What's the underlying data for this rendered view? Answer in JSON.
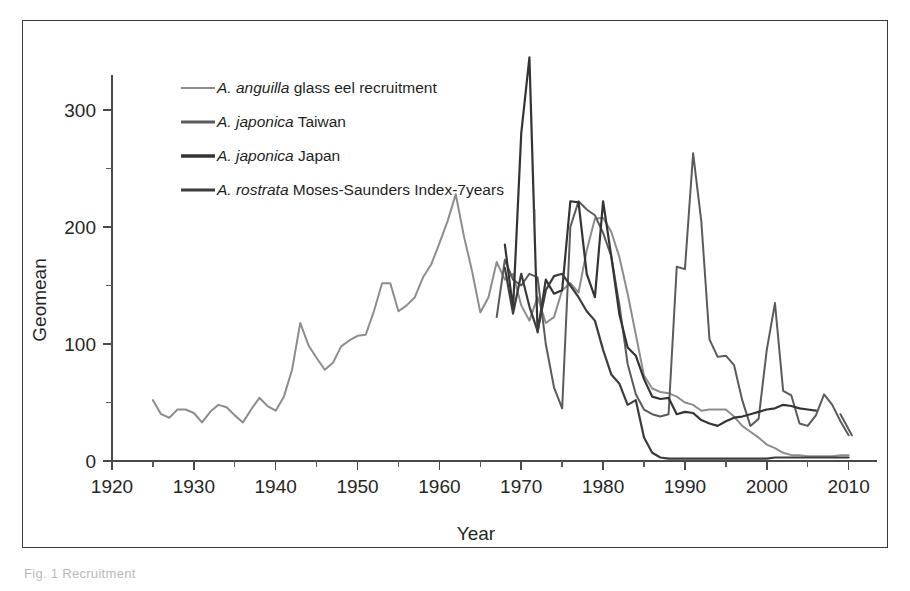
{
  "figure": {
    "caption_fragment": "Fig. 1  Recruitment",
    "frame_color": "#3a3a3a",
    "background": "#ffffff"
  },
  "chart_data": {
    "type": "line",
    "title": "",
    "xlabel": "Year",
    "ylabel": "Geomean",
    "xlim": [
      1920,
      2012
    ],
    "ylim": [
      0,
      350
    ],
    "yticks": [
      0,
      100,
      200,
      300
    ],
    "ytick_labels": [
      "0",
      "100",
      "200",
      "300"
    ],
    "yminor_step": 50,
    "xticks": [
      1920,
      1930,
      1940,
      1950,
      1960,
      1970,
      1980,
      1990,
      2000,
      2010
    ],
    "xtick_labels": [
      "1920",
      "1930",
      "1940",
      "1950",
      "1960",
      "1970",
      "1980",
      "1990",
      "2000",
      "2010"
    ],
    "xminor_step": 5,
    "grid": false,
    "legend_position": "upper-left-inside",
    "series": [
      {
        "name": "A. anguilla glass eel recruitment",
        "legend_italic": "A. anguilla",
        "legend_rest": " glass eel recruitment",
        "color": "#8d8d8d",
        "width": 2.0,
        "x": [
          1925,
          1926,
          1927,
          1928,
          1929,
          1930,
          1931,
          1932,
          1933,
          1934,
          1935,
          1936,
          1937,
          1938,
          1939,
          1940,
          1941,
          1942,
          1943,
          1944,
          1945,
          1946,
          1947,
          1948,
          1949,
          1950,
          1951,
          1952,
          1953,
          1954,
          1955,
          1956,
          1957,
          1958,
          1959,
          1960,
          1961,
          1962,
          1963,
          1964,
          1965,
          1966,
          1967,
          1968,
          1969,
          1970,
          1971,
          1972,
          1973,
          1974,
          1975,
          1976,
          1977,
          1978,
          1979,
          1980,
          1981,
          1982,
          1983,
          1984,
          1985,
          1986,
          1987,
          1988,
          1989,
          1990,
          1991,
          1992,
          1993,
          1994,
          1995,
          1996,
          1997,
          1998,
          1999,
          2000,
          2001,
          2002,
          2003,
          2004,
          2005,
          2006,
          2007,
          2008,
          2009,
          2010
        ],
        "y": [
          52,
          40,
          37,
          44,
          44,
          41,
          33,
          42,
          48,
          46,
          39,
          33,
          44,
          54,
          47,
          43,
          55,
          78,
          118,
          99,
          88,
          78,
          84,
          98,
          103,
          107,
          108,
          128,
          152,
          152,
          128,
          133,
          140,
          157,
          168,
          186,
          205,
          228,
          192,
          162,
          127,
          140,
          170,
          155,
          160,
          133,
          120,
          140,
          118,
          123,
          146,
          152,
          144,
          180,
          207,
          208,
          196,
          174,
          143,
          108,
          73,
          62,
          59,
          58,
          55,
          50,
          48,
          43,
          44,
          44,
          44,
          38,
          30,
          25,
          20,
          14,
          11,
          7,
          5,
          5,
          4,
          4,
          4,
          4,
          5,
          5
        ]
      },
      {
        "name": "A. japonica Taiwan",
        "legend_italic": "A. japonica",
        "legend_rest": " Taiwan",
        "color": "#5b5b5b",
        "width": 2.0,
        "x": [
          1967,
          1968,
          1969,
          1970,
          1971,
          1972,
          1973,
          1974,
          1975,
          1976,
          1977,
          1978,
          1979,
          1980,
          1981,
          1982,
          1983,
          1984,
          1985,
          1986,
          1987,
          1988,
          1989,
          1990,
          1991,
          1992,
          1993,
          1994,
          1995,
          1996,
          1997,
          1998,
          1999,
          2000,
          2001,
          2002,
          2003,
          2004,
          2005,
          2006,
          2007,
          2008,
          2009,
          2010
        ],
        "y": [
          123,
          172,
          155,
          150,
          160,
          157,
          100,
          63,
          45,
          200,
          222,
          215,
          210,
          195,
          175,
          133,
          83,
          57,
          44,
          40,
          38,
          40,
          166,
          164,
          263,
          205,
          104,
          89,
          90,
          82,
          52,
          30,
          36,
          95,
          135,
          60,
          56,
          32,
          30,
          39,
          57,
          48,
          34,
          22
        ]
      },
      {
        "name": "A. japonica Japan",
        "legend_italic": "A. japonica",
        "legend_rest": " Japan",
        "color": "#343434",
        "width": 2.2,
        "x": [
          1968,
          1969,
          1970,
          1971,
          1972,
          1973,
          1974,
          1975,
          1976,
          1977,
          1978,
          1979,
          1980,
          1981,
          1982,
          1983,
          1984,
          1985,
          1986,
          1987,
          1988,
          1989,
          1990,
          1991,
          1992,
          1993,
          1994,
          1995,
          1996,
          1997,
          1998,
          1999,
          2000,
          2001,
          2002,
          2003,
          2004,
          2005,
          2006
        ],
        "y": [
          185,
          130,
          280,
          345,
          110,
          155,
          143,
          146,
          222,
          221,
          160,
          140,
          222,
          175,
          125,
          97,
          90,
          70,
          55,
          53,
          54,
          40,
          42,
          41,
          35,
          32,
          30,
          34,
          37,
          38,
          40,
          42,
          44,
          45,
          48,
          47,
          45,
          44,
          43
        ]
      },
      {
        "name": "A. rostrata Moses-Saunders Index-7years",
        "legend_italic": "A. rostrata",
        "legend_rest": " Moses-Saunders Index-7years",
        "color": "#3d3d3d",
        "width": 2.2,
        "x": [
          1968,
          1969,
          1970,
          1971,
          1972,
          1973,
          1974,
          1975,
          1976,
          1977,
          1978,
          1979,
          1980,
          1981,
          1982,
          1983,
          1984,
          1985,
          1986,
          1987,
          1988,
          1989,
          1990,
          1991,
          1992,
          1993,
          1994,
          1995,
          1996,
          1997,
          1998,
          1999,
          2000,
          2001,
          2002,
          2003,
          2004,
          2005,
          2006,
          2007,
          2008,
          2009,
          2010
        ],
        "y": [
          165,
          126,
          160,
          132,
          111,
          146,
          158,
          160,
          150,
          140,
          128,
          120,
          95,
          74,
          66,
          48,
          52,
          20,
          7,
          3,
          2,
          2,
          2,
          2,
          2,
          2,
          2,
          2,
          2,
          2,
          2,
          2,
          2,
          3,
          3,
          3,
          3,
          3,
          3,
          3,
          3,
          3,
          3
        ]
      }
    ],
    "orphan_segments": [
      {
        "name": "tick-mark-artifact",
        "color": "#4a4a4a",
        "x": [
          1971.6,
          1971.6
        ],
        "y": [
          205,
          215
        ]
      },
      {
        "name": "japonica-taiwan-tail",
        "color": "#5b5b5b",
        "x": [
          2009.0,
          2010.4
        ],
        "y": [
          40,
          22
        ]
      }
    ]
  }
}
